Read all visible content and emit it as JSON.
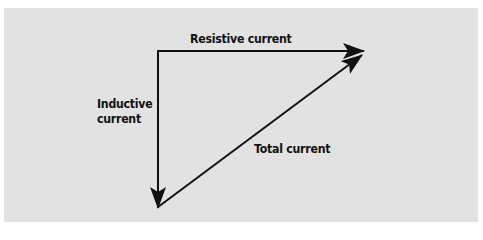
{
  "diagram": {
    "background_color": "#e2e2e2",
    "line_color": "#111111",
    "labels": {
      "resistive": "Resistive current",
      "inductive_line1": "Inductive",
      "inductive_line2": "current",
      "total": "Total current"
    },
    "vectors": [
      {
        "name": "Resistive current",
        "from": [
          158,
          51
        ],
        "to": [
          364,
          51
        ]
      },
      {
        "name": "Inductive current",
        "from": [
          158,
          51
        ],
        "to": [
          158,
          207
        ]
      },
      {
        "name": "Total current",
        "from": [
          158,
          207
        ],
        "to": [
          362,
          55
        ]
      }
    ]
  }
}
